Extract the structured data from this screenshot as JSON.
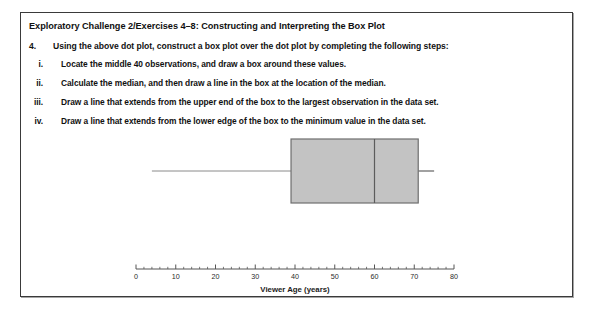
{
  "document": {
    "heading": "Exploratory Challenge 2/Exercises 4–8:  Constructing and Interpreting the Box Plot",
    "question": {
      "number": "4.",
      "text": "Using the above dot plot, construct a box plot over the dot plot by completing the following steps:"
    },
    "steps": [
      {
        "marker": "i.",
        "text": "Locate the middle 40 observations, and draw a box around these values."
      },
      {
        "marker": "ii.",
        "text": "Calculate the median, and then draw a line in the box at the location of the median."
      },
      {
        "marker": "iii.",
        "text": "Draw a line that extends from the upper end of the box to the largest observation in the data set."
      },
      {
        "marker": "iv.",
        "text": "Draw a line that extends from the lower edge of the box to the minimum value in the data set."
      }
    ]
  },
  "chart_data": {
    "type": "boxplot",
    "title": "",
    "xlabel": "Viewer Age (years)",
    "ylabel": "",
    "xlim": [
      0,
      80
    ],
    "x_major_ticks": [
      0,
      10,
      20,
      30,
      40,
      50,
      60,
      70,
      80
    ],
    "x_tick_labels": [
      "0",
      "10",
      "20",
      "30",
      "40",
      "50",
      "60",
      "70",
      "80"
    ],
    "x_minor_tick_step": 2,
    "grid": false,
    "legend": "none",
    "box": {
      "whisker_low": 4,
      "q1": 39,
      "median": 60,
      "q3": 71,
      "whisker_high": 75
    },
    "colors": {
      "box_fill": "#c3c3c3",
      "box_stroke": "#6e6e6e",
      "median_stroke": "#5c5c5c",
      "whisker_stroke": "#8a8a8a",
      "axis_stroke": "#555555"
    }
  }
}
